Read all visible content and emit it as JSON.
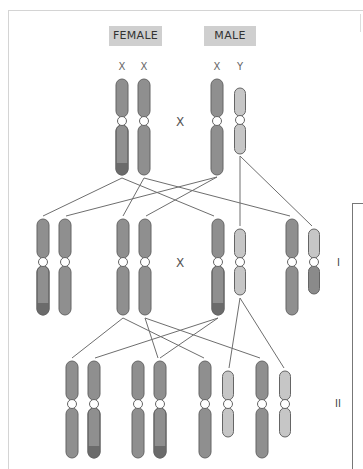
{
  "diagram": {
    "parents": {
      "female_label": "FEMALE",
      "male_label": "MALE",
      "female_chromosomes": [
        "X",
        "X"
      ],
      "male_chromosomes": [
        "X",
        "Y"
      ],
      "cross_symbol": "X"
    },
    "generations": [
      {
        "label": "I",
        "cross_symbol": "X"
      },
      {
        "label": "II"
      }
    ],
    "colors": {
      "chromosome_fill": "#8f8f8f",
      "chromosome_outline": "#656565",
      "y_chromosome_fill": "#c6c6c6",
      "marked_tip": "#6b6b6b",
      "label_box": "#cfcfcf",
      "line": "#6e6e6e"
    },
    "chromosomes": {
      "parents": [
        {
          "cx": 122,
          "top": 79,
          "cen": 121,
          "bottom": 175,
          "type": "X",
          "tip": true
        },
        {
          "cx": 144,
          "top": 79,
          "cen": 121,
          "bottom": 175,
          "type": "X",
          "tip": false
        },
        {
          "cx": 217,
          "top": 79,
          "cen": 121,
          "bottom": 175,
          "type": "X",
          "tip": false
        },
        {
          "cx": 240,
          "top": 88,
          "cen": 120,
          "bottom": 154,
          "type": "Y",
          "tip": false
        }
      ],
      "gen1": [
        {
          "cx": 43,
          "top": 219,
          "cen": 262,
          "bottom": 315,
          "type": "X",
          "tip": true
        },
        {
          "cx": 65,
          "top": 219,
          "cen": 262,
          "bottom": 315,
          "type": "X",
          "tip": false
        },
        {
          "cx": 123,
          "top": 219,
          "cen": 262,
          "bottom": 315,
          "type": "X",
          "tip": false
        },
        {
          "cx": 145,
          "top": 219,
          "cen": 262,
          "bottom": 315,
          "type": "X",
          "tip": false
        },
        {
          "cx": 218,
          "top": 219,
          "cen": 262,
          "bottom": 315,
          "type": "X",
          "tip": true
        },
        {
          "cx": 240,
          "top": 229,
          "cen": 262,
          "bottom": 295,
          "type": "Y",
          "tip": false
        },
        {
          "cx": 292,
          "top": 219,
          "cen": 262,
          "bottom": 315,
          "type": "X",
          "tip": false
        },
        {
          "cx": 314,
          "top": 229,
          "cen": 262,
          "bottom": 294,
          "type": "Y",
          "lowerDark": true
        }
      ],
      "gen2": [
        {
          "cx": 72,
          "top": 361,
          "cen": 404,
          "bottom": 458,
          "type": "X",
          "tip": false
        },
        {
          "cx": 94,
          "top": 361,
          "cen": 404,
          "bottom": 458,
          "type": "X",
          "tip": true
        },
        {
          "cx": 138,
          "top": 361,
          "cen": 404,
          "bottom": 458,
          "type": "X",
          "tip": false
        },
        {
          "cx": 160,
          "top": 361,
          "cen": 404,
          "bottom": 458,
          "type": "X",
          "tip": true
        },
        {
          "cx": 205,
          "top": 361,
          "cen": 404,
          "bottom": 458,
          "type": "X",
          "tip": false
        },
        {
          "cx": 228,
          "top": 371,
          "cen": 404,
          "bottom": 437,
          "type": "Y",
          "tip": false
        },
        {
          "cx": 262,
          "top": 361,
          "cen": 404,
          "bottom": 458,
          "type": "X",
          "tip": false
        },
        {
          "cx": 285,
          "top": 371,
          "cen": 404,
          "bottom": 437,
          "type": "Y",
          "tip": false
        }
      ]
    },
    "lines": [
      [
        122,
        178,
        43,
        216
      ],
      [
        122,
        178,
        214,
        216
      ],
      [
        144,
        178,
        123,
        216
      ],
      [
        144,
        178,
        290,
        216
      ],
      [
        217,
        177,
        66,
        216
      ],
      [
        217,
        177,
        146,
        216
      ],
      [
        240,
        156,
        240,
        226
      ],
      [
        240,
        156,
        312,
        226
      ],
      [
        123,
        318,
        72,
        358
      ],
      [
        123,
        318,
        204,
        358
      ],
      [
        145,
        318,
        158,
        358
      ],
      [
        145,
        318,
        260,
        358
      ],
      [
        218,
        318,
        95,
        358
      ],
      [
        218,
        318,
        160,
        358
      ],
      [
        240,
        298,
        229,
        368
      ],
      [
        240,
        298,
        284,
        368
      ]
    ]
  }
}
